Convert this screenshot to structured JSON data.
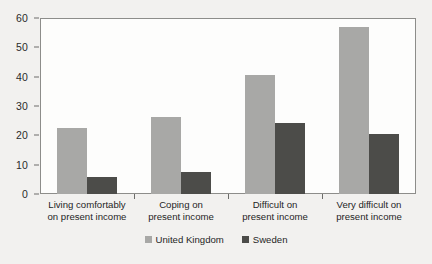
{
  "chart_data": {
    "type": "bar",
    "title": "",
    "subtitle": "",
    "xlabel": "",
    "ylabel": "",
    "ylim": [
      0,
      60
    ],
    "yticks": [
      0,
      10,
      20,
      30,
      40,
      50,
      60
    ],
    "ytick_labels": [
      "0",
      "10",
      "20",
      "30",
      "40",
      "50",
      "60"
    ],
    "grid": false,
    "legend_position": "bottom-center",
    "categories": [
      "Living comfortably on present income",
      "Coping on present income",
      "Difficult on present income",
      "Very difficult on present income"
    ],
    "category_lines": [
      [
        "Living comfortably",
        "on present income"
      ],
      [
        "Coping on",
        "present income"
      ],
      [
        "Difficult on",
        "present income"
      ],
      [
        "Very difficult on",
        "present income"
      ]
    ],
    "series": [
      {
        "name": "United Kingdom",
        "color": "#a8a8a6",
        "values": [
          22.5,
          26.3,
          40.5,
          57.0
        ]
      },
      {
        "name": "Sweden",
        "color": "#4c4c49",
        "values": [
          5.8,
          7.6,
          24.2,
          20.3
        ]
      }
    ]
  },
  "legend": {
    "items": [
      {
        "label": "United Kingdom",
        "color": "#a8a8a6"
      },
      {
        "label": "Sweden",
        "color": "#4c4c49"
      }
    ]
  }
}
